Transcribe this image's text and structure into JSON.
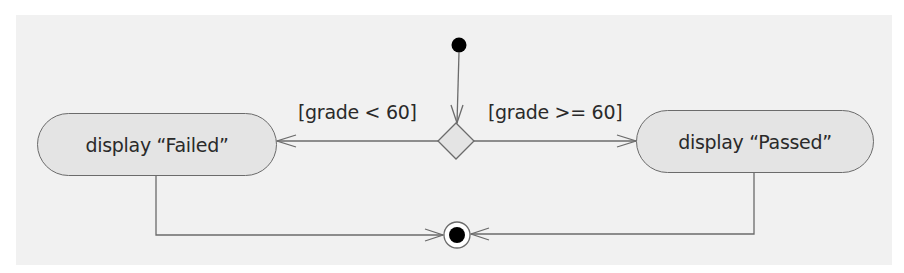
{
  "diagram": {
    "type": "UML activity diagram",
    "initial_node": {
      "label": ""
    },
    "decision_node": {
      "label": ""
    },
    "final_node": {
      "label": ""
    },
    "actions": [
      {
        "id": "failed",
        "label": "display “Failed”"
      },
      {
        "id": "passed",
        "label": "display “Passed”"
      }
    ],
    "guards": [
      {
        "id": "fail-guard",
        "label": "[grade < 60]",
        "target": "failed"
      },
      {
        "id": "pass-guard",
        "label": "[grade >= 60]",
        "target": "passed"
      }
    ],
    "edges": [
      {
        "from": "initial",
        "to": "decision"
      },
      {
        "from": "decision",
        "to": "failed",
        "guard": "[grade < 60]"
      },
      {
        "from": "decision",
        "to": "passed",
        "guard": "[grade >= 60]"
      },
      {
        "from": "failed",
        "to": "final"
      },
      {
        "from": "passed",
        "to": "final"
      }
    ],
    "colors": {
      "panel_background": "#f1f1f1",
      "action_fill": "#e4e4e4",
      "line": "#6b6b6b",
      "node_fill": "#000000"
    }
  }
}
